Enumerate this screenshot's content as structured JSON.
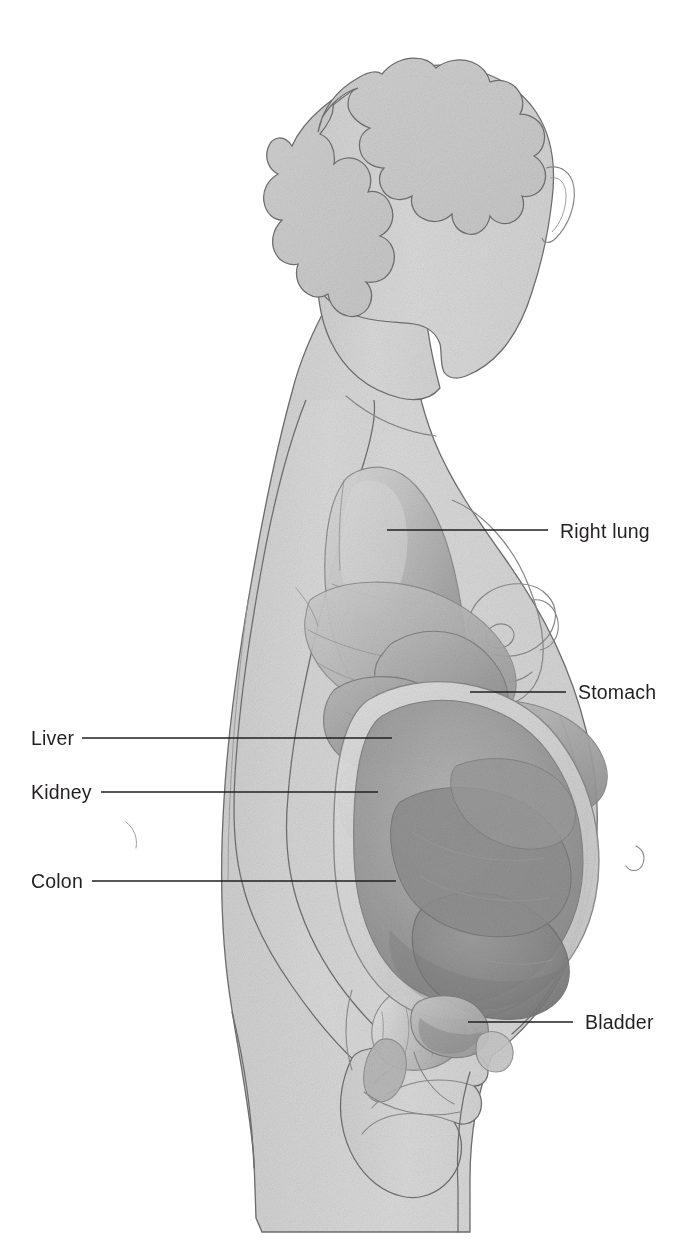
{
  "figure": {
    "background_color": "#ffffff",
    "width": 698,
    "height": 1260
  },
  "palette": {
    "body_fill": "#d6d6d6",
    "body_fill_light": "#dedede",
    "body_outline": "#6f6f70",
    "organ_light": "#c3c3c3",
    "organ_mid": "#a8a8a8",
    "organ_dark": "#8f8f8f",
    "organ_darkest": "#7b7b7b",
    "uterus": "#9a9a9a",
    "highlight": "#efefef",
    "leader_line": "#231f20",
    "label_text": "#231f20"
  },
  "labels": [
    {
      "id": "right-lung",
      "text": "Right lung",
      "side": "right",
      "text_x": 560,
      "text_y": 538,
      "leader": {
        "x1": 387,
        "y1": 530,
        "x2": 548,
        "y2": 530
      }
    },
    {
      "id": "stomach",
      "text": "Stomach",
      "side": "right",
      "text_x": 578,
      "text_y": 699,
      "leader": {
        "x1": 470,
        "y1": 692,
        "x2": 566,
        "y2": 692
      }
    },
    {
      "id": "liver",
      "text": "Liver",
      "side": "left",
      "text_x": 31,
      "text_y": 745,
      "leader": {
        "x1": 82,
        "y1": 738,
        "x2": 392,
        "y2": 738
      }
    },
    {
      "id": "kidney",
      "text": "Kidney",
      "side": "left",
      "text_x": 31,
      "text_y": 799,
      "leader": {
        "x1": 101,
        "y1": 792,
        "x2": 378,
        "y2": 792
      }
    },
    {
      "id": "colon",
      "text": "Colon",
      "side": "left",
      "text_x": 31,
      "text_y": 888,
      "leader": {
        "x1": 92,
        "y1": 881,
        "x2": 396,
        "y2": 881
      }
    },
    {
      "id": "bladder",
      "text": "Bladder",
      "side": "right",
      "text_x": 585,
      "text_y": 1029,
      "leader": {
        "x1": 468,
        "y1": 1022,
        "x2": 573,
        "y2": 1022
      }
    }
  ],
  "anatomy_parts": [
    {
      "id": "hair",
      "name": "Hair"
    },
    {
      "id": "head",
      "name": "Head and face in profile"
    },
    {
      "id": "ear",
      "name": "Ear"
    },
    {
      "id": "neck",
      "name": "Neck"
    },
    {
      "id": "torso",
      "name": "Torso"
    },
    {
      "id": "breast",
      "name": "Breast"
    },
    {
      "id": "areola",
      "name": "Areola and nipple"
    },
    {
      "id": "arm",
      "name": "Arm"
    },
    {
      "id": "hand",
      "name": "Hand"
    },
    {
      "id": "thigh",
      "name": "Thigh"
    },
    {
      "id": "lung",
      "name": "Right lung"
    },
    {
      "id": "diaphragm",
      "name": "Diaphragm"
    },
    {
      "id": "stomach",
      "name": "Stomach"
    },
    {
      "id": "liver",
      "name": "Liver"
    },
    {
      "id": "kidney",
      "name": "Kidney"
    },
    {
      "id": "colon",
      "name": "Colon with haustra"
    },
    {
      "id": "small-intestine",
      "name": "Small intestine loops"
    },
    {
      "id": "uterus",
      "name": "Gravid uterus"
    },
    {
      "id": "fetus",
      "name": "Fetus"
    },
    {
      "id": "bladder",
      "name": "Bladder"
    },
    {
      "id": "pelvis",
      "name": "Pelvic structures"
    }
  ]
}
